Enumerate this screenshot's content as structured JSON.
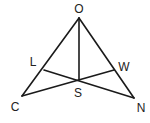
{
  "diagram": {
    "type": "geometry",
    "points": {
      "O": {
        "label": "O",
        "x": 79,
        "y": 18,
        "lx": 79,
        "ly": 13
      },
      "C": {
        "label": "C",
        "x": 22,
        "y": 96,
        "lx": 15,
        "ly": 111
      },
      "N": {
        "label": "N",
        "x": 134,
        "y": 98,
        "lx": 141,
        "ly": 112
      },
      "L": {
        "label": "L",
        "x": 44,
        "y": 70,
        "lx": 33,
        "ly": 66
      },
      "W": {
        "label": "W",
        "x": 114,
        "y": 70,
        "lx": 124,
        "ly": 71
      },
      "S": {
        "label": "S",
        "x": 79,
        "y": 80,
        "lx": 78,
        "ly": 97
      }
    },
    "segments": [
      [
        "O",
        "C"
      ],
      [
        "O",
        "N"
      ],
      [
        "O",
        "S"
      ],
      [
        "C",
        "W"
      ],
      [
        "N",
        "L"
      ]
    ],
    "line_color": "#1a1a1a",
    "label_color": "#222222"
  }
}
